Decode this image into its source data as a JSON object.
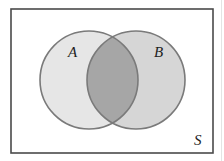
{
  "diagram": {
    "type": "venn",
    "universe": {
      "label": "S",
      "x": 11,
      "y": 9,
      "width": 202,
      "height": 144,
      "border_color": "#4a4a4a",
      "fill": "#ffffff"
    },
    "sets": [
      {
        "label": "A",
        "cx": 89,
        "cy": 80,
        "r": 49,
        "fill": "#e6e6e6",
        "stroke": "#7a7a7a"
      },
      {
        "label": "B",
        "cx": 136,
        "cy": 80,
        "r": 49,
        "fill": "#d6d6d6",
        "stroke": "#7a7a7a"
      }
    ],
    "intersection": {
      "label": "A ∩ B",
      "fill": "#a6a6a6",
      "shaded": true
    },
    "labels": {
      "A": {
        "text": "A",
        "x": 68,
        "y": 57
      },
      "B": {
        "text": "B",
        "x": 154,
        "y": 57
      },
      "S": {
        "text": "S",
        "x": 194,
        "y": 145
      }
    }
  }
}
